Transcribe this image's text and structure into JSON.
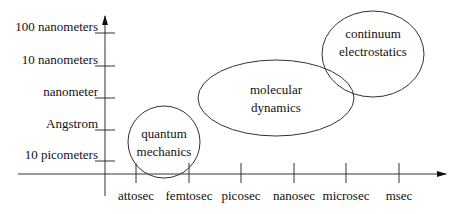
{
  "diagram": {
    "type": "scale-regimes",
    "y_axis": {
      "ticks": [
        {
          "label": "100 nanometers",
          "y": 33
        },
        {
          "label": "10 nanometers",
          "y": 66
        },
        {
          "label": "nanometer",
          "y": 98
        },
        {
          "label": "Angstrom",
          "y": 130
        },
        {
          "label": "10 picometers",
          "y": 161
        }
      ]
    },
    "x_axis": {
      "ticks": [
        {
          "label": "attosec",
          "x": 136
        },
        {
          "label": "femtosec",
          "x": 189
        },
        {
          "label": "picosec",
          "x": 241
        },
        {
          "label": "nanosec",
          "x": 294
        },
        {
          "label": "microsec",
          "x": 346
        },
        {
          "label": "msec",
          "x": 399
        }
      ]
    },
    "regions": [
      {
        "name": "quantum mechanics",
        "lines": [
          "quantum",
          "mechanics"
        ],
        "cx": 164,
        "cy": 142,
        "rx": 36,
        "ry": 36
      },
      {
        "name": "molecular dynamics",
        "lines": [
          "molecular",
          "dynamics"
        ],
        "cx": 276,
        "cy": 98,
        "rx": 78,
        "ry": 38
      },
      {
        "name": "continuum electrostatics",
        "lines": [
          "continuum",
          "electrostatics"
        ],
        "cx": 373,
        "cy": 54,
        "rx": 51,
        "ry": 43
      }
    ]
  }
}
